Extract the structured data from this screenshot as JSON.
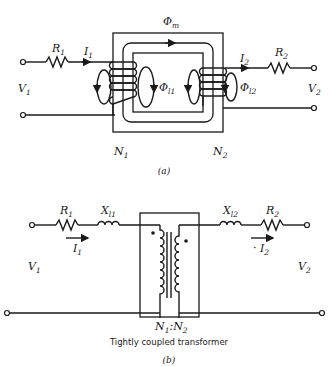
{
  "figure_a": {
    "caption": "(a)",
    "labels": {
      "R1": "R",
      "R1_sub": "1",
      "I1": "I",
      "I1_sub": "1",
      "V1": "V",
      "V1_sub": "1",
      "R2": "R",
      "R2_sub": "2",
      "I2": "I",
      "I2_sub": "2",
      "V2": "V",
      "V2_sub": "2",
      "phi_m": "Φ",
      "phi_m_sub": "m",
      "phi_l1": "Φ",
      "phi_l1_sub": "l1",
      "phi_l2": "Φ",
      "phi_l2_sub": "l2",
      "N1": "N",
      "N1_sub": "1",
      "N2": "N",
      "N2_sub": "2"
    }
  },
  "figure_b": {
    "caption": "(b)",
    "note": "Tightly coupled transformer",
    "labels": {
      "R1": "R",
      "R1_sub": "1",
      "X1": "X",
      "X1_sub": "l1",
      "I1": "I",
      "I1_sub": "1",
      "V1": "V",
      "V1_sub": "1",
      "R2": "R",
      "R2_sub": "2",
      "X2": "X",
      "X2_sub": "l2",
      "I2": "I",
      "I2_sub": "2",
      "V2": "V",
      "V2_sub": "2",
      "ratio_N1": "N",
      "ratio_N1_sub": "1",
      "ratio_sep": ":",
      "ratio_N2": "N",
      "ratio_N2_sub": "2"
    }
  }
}
